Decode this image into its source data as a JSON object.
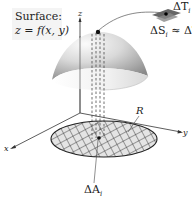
{
  "figure": {
    "surface_title": "Surface:",
    "surface_equation": "z = f(x, y)",
    "axes": {
      "x": "x",
      "y": "y",
      "z": "z"
    },
    "region_label": "R",
    "area_element_label": "ΔA",
    "area_element_sub": "i",
    "tangent_patch_label": "ΔT",
    "tangent_patch_sub": "i",
    "approx_label": "ΔS",
    "approx_sub": "i",
    "approx_eq": " ≈ ΔT",
    "approx_eq_sub": "i"
  },
  "colors": {
    "surface_light": "#f2f2f2",
    "surface_dark": "#9a9a9a",
    "region_fill": "#d9d9d9",
    "line": "#333333"
  }
}
